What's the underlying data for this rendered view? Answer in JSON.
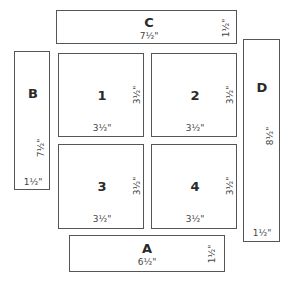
{
  "pieces": {
    "C": {
      "label": "C",
      "width": "7½\"",
      "height": "1½\""
    },
    "B": {
      "label": "B",
      "height": "7½\"",
      "width": "1½\""
    },
    "D": {
      "label": "D",
      "height": "8½\"",
      "width": "1½\""
    },
    "A": {
      "label": "A",
      "width": "6½\"",
      "height": "1½\""
    },
    "p1": {
      "label": "1",
      "width": "3½\"",
      "height": "3½\""
    },
    "p2": {
      "label": "2",
      "width": "3½\"",
      "height": "3½\""
    },
    "p3": {
      "label": "3",
      "width": "3½\"",
      "height": "3½\""
    },
    "p4": {
      "label": "4",
      "width": "3½\"",
      "height": "3½\""
    }
  }
}
